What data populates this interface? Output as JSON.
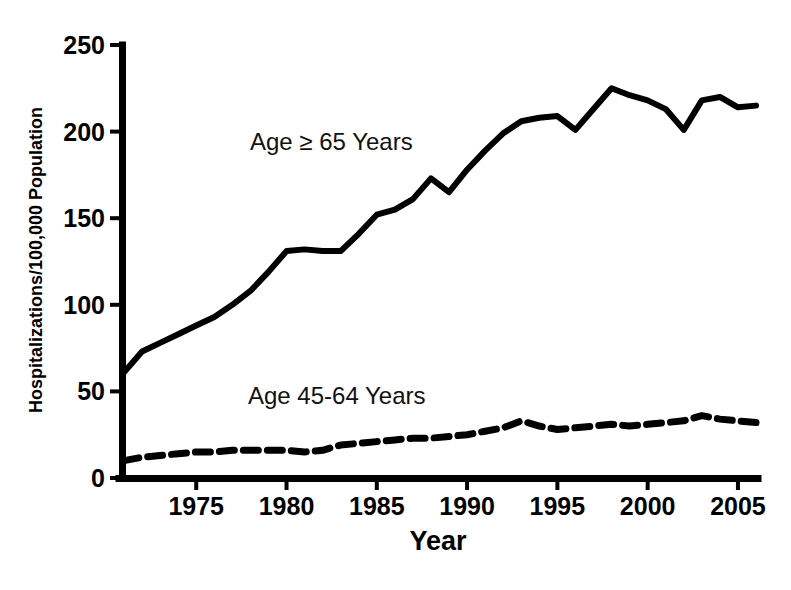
{
  "chart_data": {
    "type": "line",
    "title": "",
    "xlabel": "Year",
    "ylabel": "Hospitalizations/100,000 Population",
    "xlim": [
      1971,
      2006
    ],
    "ylim": [
      0,
      250
    ],
    "grid": false,
    "legend_position": "inline-annotation",
    "x_ticks": [
      "1975",
      "1980",
      "1985",
      "1990",
      "1995",
      "2000",
      "2005"
    ],
    "x_tick_values": [
      1975,
      1980,
      1985,
      1990,
      1995,
      2000,
      2005
    ],
    "y_ticks": [
      "0",
      "50",
      "100",
      "150",
      "200",
      "250"
    ],
    "y_tick_values": [
      0,
      50,
      100,
      150,
      200,
      250
    ],
    "x": [
      1971,
      1972,
      1973,
      1974,
      1975,
      1976,
      1977,
      1978,
      1979,
      1980,
      1981,
      1982,
      1983,
      1984,
      1985,
      1986,
      1987,
      1988,
      1989,
      1990,
      1991,
      1992,
      1993,
      1994,
      1995,
      1996,
      1997,
      1998,
      1999,
      2000,
      2001,
      2002,
      2003,
      2004,
      2005,
      2006
    ],
    "series": [
      {
        "name": "Age ≥ 65 Years",
        "style": "solid",
        "color": "#000000",
        "values": [
          61,
          73,
          78,
          83,
          88,
          93,
          100,
          108,
          119,
          131,
          132,
          131,
          131,
          141,
          152,
          155,
          161,
          173,
          165,
          178,
          189,
          199,
          206,
          208,
          209,
          201,
          213,
          225,
          221,
          218,
          213,
          201,
          218,
          220,
          214,
          215
        ]
      },
      {
        "name": "Age 45-64 Years",
        "style": "dashed",
        "color": "#000000",
        "values": [
          10,
          12,
          13,
          14,
          15,
          15,
          16,
          16,
          16,
          16,
          15,
          16,
          19,
          20,
          21,
          22,
          23,
          23,
          24,
          25,
          27,
          29,
          33,
          30,
          28,
          29,
          30,
          31,
          30,
          31,
          32,
          33,
          36,
          34,
          33,
          32
        ]
      }
    ],
    "annotations": [
      {
        "text": "Age ≥ 65 Years",
        "x_px": 250,
        "y_px": 150
      },
      {
        "text": "Age 45-64 Years",
        "x_px": 248,
        "y_px": 404
      }
    ]
  },
  "axes": {
    "y_axis_title": "Hospitalizations/100,000 Population",
    "x_axis_title": "Year"
  }
}
